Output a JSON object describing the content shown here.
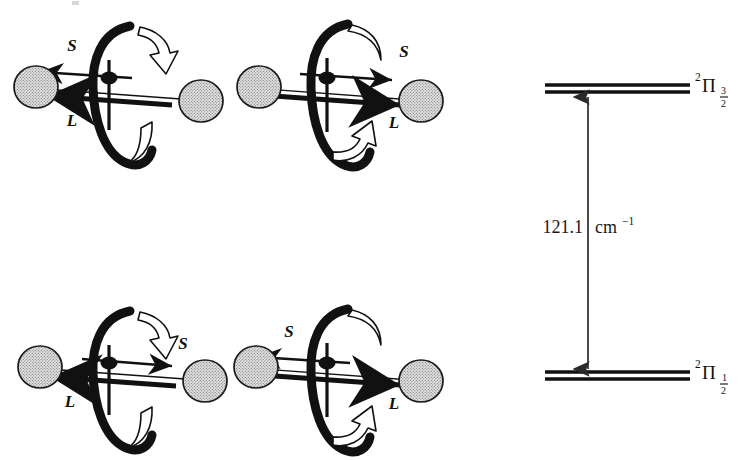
{
  "figure": {
    "kind": "spin-orbit-coupling-and-energy-level-diagram",
    "background_color": "#ffffff",
    "ink_color": "#111111",
    "sphere_fill": "#c9c9c9",
    "sphere_stroke": "#1a1a1a"
  },
  "panels": [
    {
      "id": "top-left",
      "s_label": "S",
      "l_label": "L",
      "s_direction": "left",
      "l_direction": "left",
      "rotation_arrow_top": "down-right-open-arrow",
      "rotation_arrow_bottom": "open-hook",
      "sphere_left": "shaded-sphere",
      "sphere_right": "shaded-sphere"
    },
    {
      "id": "top-right",
      "s_label": "S",
      "l_label": "L",
      "s_direction": "right",
      "l_direction": "right",
      "rotation_arrow_top": "open-hook",
      "rotation_arrow_bottom": "up-right-open-arrow",
      "sphere_left": "shaded-sphere",
      "sphere_right": "shaded-sphere"
    },
    {
      "id": "bottom-left",
      "s_label": "S",
      "l_label": "L",
      "s_direction": "right",
      "l_direction": "left",
      "rotation_arrow_top": "down-right-open-arrow",
      "rotation_arrow_bottom": "open-hook",
      "sphere_left": "shaded-sphere",
      "sphere_right": "shaded-sphere"
    },
    {
      "id": "bottom-right",
      "s_label": "S",
      "l_label": "L",
      "s_direction": "left",
      "l_direction": "right",
      "rotation_arrow_top": "open-hook",
      "rotation_arrow_bottom": "up-right-open-arrow",
      "sphere_left": "shaded-sphere",
      "sphere_right": "shaded-sphere"
    }
  ],
  "energy_diagram": {
    "upper_level": {
      "superscript": "2",
      "symbol": "Π",
      "sub_numerator": "3",
      "sub_denominator": "2"
    },
    "lower_level": {
      "superscript": "2",
      "symbol": "Π",
      "sub_numerator": "1",
      "sub_denominator": "2"
    },
    "separation_value": "121.1",
    "separation_unit": "cm",
    "separation_unit_exponent": "−1",
    "arrow_style": "double-headed-vertical"
  }
}
